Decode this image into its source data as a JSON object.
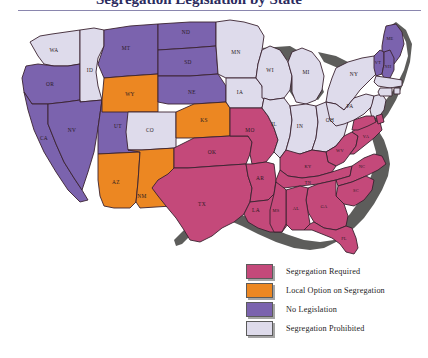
{
  "title": {
    "text": "Segregation Legislation by State"
  },
  "legend": {
    "items": [
      {
        "label": "Segregation Required",
        "color": "#c4497a",
        "key": "required"
      },
      {
        "label": "Local Option on Segregation",
        "color": "#ec8722",
        "key": "local"
      },
      {
        "label": "No Legislation",
        "color": "#7b63ae",
        "key": "none"
      },
      {
        "label": "Segregation Prohibited",
        "color": "#dedbeb",
        "key": "prohibited"
      }
    ]
  },
  "colors": {
    "required": "#c4497a",
    "local": "#ec8722",
    "none": "#7b63ae",
    "prohibited": "#dedbeb",
    "water": "#5d5d5b",
    "border": "#3a2330",
    "background": "#ffffff",
    "rule": "#8a86ae",
    "title_ink": "#2b2b5e"
  },
  "map": {
    "name": "united-states-segregation-legislation-map",
    "states": [
      {
        "abbr": "WA",
        "category": "prohibited"
      },
      {
        "abbr": "OR",
        "category": "none"
      },
      {
        "abbr": "ID",
        "category": "prohibited"
      },
      {
        "abbr": "MT",
        "category": "none"
      },
      {
        "abbr": "ND",
        "category": "none"
      },
      {
        "abbr": "MN",
        "category": "prohibited"
      },
      {
        "abbr": "WI",
        "category": "prohibited"
      },
      {
        "abbr": "MI",
        "category": "prohibited"
      },
      {
        "abbr": "NY",
        "category": "prohibited"
      },
      {
        "abbr": "ME",
        "category": "none"
      },
      {
        "abbr": "VT",
        "category": "none"
      },
      {
        "abbr": "NH",
        "category": "none"
      },
      {
        "abbr": "MA",
        "category": "prohibited"
      },
      {
        "abbr": "RI",
        "category": "prohibited"
      },
      {
        "abbr": "CT",
        "category": "prohibited"
      },
      {
        "abbr": "PA",
        "category": "prohibited"
      },
      {
        "abbr": "NJ",
        "category": "prohibited"
      },
      {
        "abbr": "OH",
        "category": "prohibited"
      },
      {
        "abbr": "IN",
        "category": "prohibited"
      },
      {
        "abbr": "IL",
        "category": "prohibited"
      },
      {
        "abbr": "IA",
        "category": "prohibited"
      },
      {
        "abbr": "SD",
        "category": "none"
      },
      {
        "abbr": "NE",
        "category": "none"
      },
      {
        "abbr": "WY",
        "category": "local"
      },
      {
        "abbr": "NV",
        "category": "none"
      },
      {
        "abbr": "UT",
        "category": "none"
      },
      {
        "abbr": "CA",
        "category": "none"
      },
      {
        "abbr": "CO",
        "category": "prohibited"
      },
      {
        "abbr": "KS",
        "category": "local"
      },
      {
        "abbr": "AZ",
        "category": "local"
      },
      {
        "abbr": "NM",
        "category": "local"
      },
      {
        "abbr": "OK",
        "category": "required"
      },
      {
        "abbr": "TX",
        "category": "required"
      },
      {
        "abbr": "MO",
        "category": "required"
      },
      {
        "abbr": "AR",
        "category": "required"
      },
      {
        "abbr": "LA",
        "category": "required"
      },
      {
        "abbr": "MS",
        "category": "required"
      },
      {
        "abbr": "AL",
        "category": "required"
      },
      {
        "abbr": "GA",
        "category": "required"
      },
      {
        "abbr": "FL",
        "category": "required"
      },
      {
        "abbr": "SC",
        "category": "required"
      },
      {
        "abbr": "NC",
        "category": "required"
      },
      {
        "abbr": "TN",
        "category": "required"
      },
      {
        "abbr": "KY",
        "category": "required"
      },
      {
        "abbr": "WV",
        "category": "required"
      },
      {
        "abbr": "VA",
        "category": "required"
      },
      {
        "abbr": "MD",
        "category": "required"
      },
      {
        "abbr": "DE",
        "category": "required"
      }
    ]
  }
}
